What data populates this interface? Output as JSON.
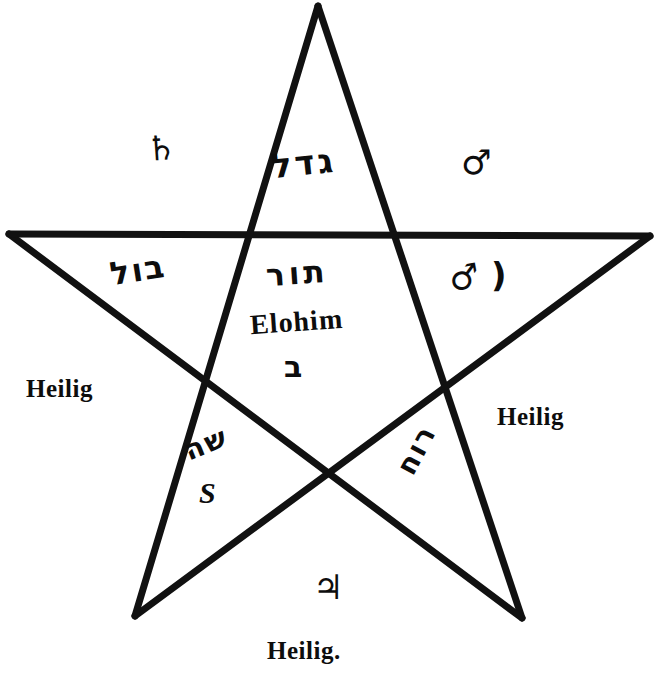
{
  "figure": {
    "name": "pentagram-diagram",
    "stroke_color": "#111111",
    "background_color": "#ffffff",
    "caption": "Heilig."
  },
  "corner_words": {
    "left": "Heilig",
    "right": "Heilig",
    "bottom": "Heilig."
  },
  "planet_glyphs": {
    "saturn": "♄",
    "mars": "♂",
    "jupiter": "♃",
    "venus_mars_pair": "♂",
    "moon": ")"
  },
  "hebrew": {
    "top_point": "גדל",
    "upper_left": "בול",
    "center_top": "תור",
    "center_bottom": "ב",
    "lower_left": "שה",
    "lower_right": "רוח"
  },
  "latin": {
    "divine_name": "Elohim",
    "lower_left_letter": "S"
  },
  "icon_names": {
    "saturn": "saturn-glyph-icon",
    "mars": "mars-glyph-icon",
    "jupiter": "jupiter-glyph-icon",
    "moon": "crescent-moon-icon",
    "star": "pentagram-star-icon"
  }
}
